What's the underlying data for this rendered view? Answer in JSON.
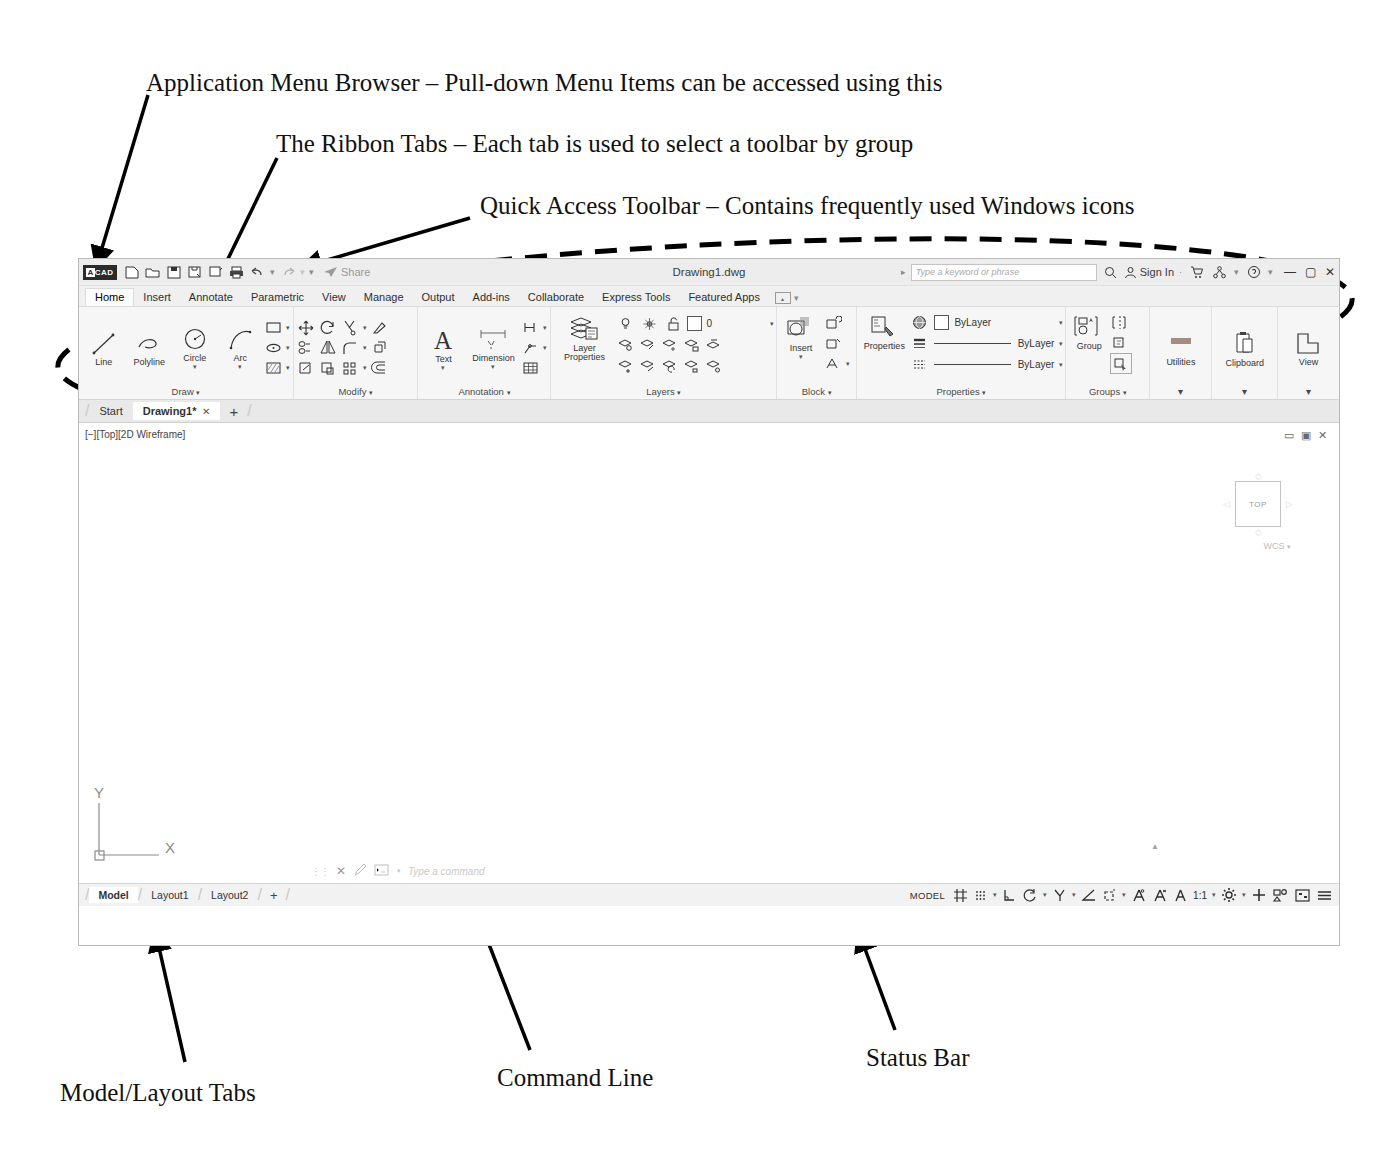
{
  "annotations": [
    {
      "id": "app-menu-browser",
      "text": "Application Menu Browser – Pull-down Menu Items can be accessed using this"
    },
    {
      "id": "ribbon-tabs",
      "text": "The Ribbon Tabs – Each tab is used to select a toolbar by group"
    },
    {
      "id": "quick-access-toolbar",
      "text": "Quick Access Toolbar – Contains frequently used Windows icons"
    },
    {
      "id": "ribbon",
      "text": "The Ribbon – Contains\nPanels which are a style of\ntoolbars tabulated by group"
    },
    {
      "id": "drawing-area",
      "text": "Drawing Area"
    },
    {
      "id": "model-layout-tabs",
      "text": "Model/Layout Tabs"
    },
    {
      "id": "command-line",
      "text": "Command Line"
    },
    {
      "id": "status-bar",
      "text": "Status Bar"
    }
  ],
  "app": {
    "logo": "CAD",
    "title": "Drawing1.dwg",
    "quick_access": [
      "new-icon",
      "open-icon",
      "save-icon",
      "saveas-icon",
      "plot-icon",
      "print-icon",
      "undo-icon",
      "redo-icon",
      "customize-icon"
    ],
    "share_label": "Share",
    "search_placeholder": "Type a keyword or phrase",
    "search_icon": "search-icon",
    "signin_label": "Sign In",
    "signin_icon": "person-icon",
    "titlebar_extras": [
      "cart-icon",
      "share-network-icon",
      "help-icon"
    ],
    "window_buttons": [
      "minimize",
      "maximize",
      "close"
    ],
    "ribbon_tabs": [
      {
        "label": "Home",
        "active": true
      },
      {
        "label": "Insert",
        "active": false
      },
      {
        "label": "Annotate",
        "active": false
      },
      {
        "label": "Parametric",
        "active": false
      },
      {
        "label": "View",
        "active": false
      },
      {
        "label": "Manage",
        "active": false
      },
      {
        "label": "Output",
        "active": false
      },
      {
        "label": "Add-ins",
        "active": false
      },
      {
        "label": "Collaborate",
        "active": false
      },
      {
        "label": "Express Tools",
        "active": false
      },
      {
        "label": "Featured Apps",
        "active": false
      }
    ],
    "ribbon_panels": [
      {
        "title": "Draw",
        "buttons": [
          "Line",
          "Polyline",
          "Circle",
          "Arc"
        ]
      },
      {
        "title": "Modify",
        "buttons": []
      },
      {
        "title": "Annotation",
        "buttons": [
          "Text",
          "Dimension"
        ]
      },
      {
        "title": "Layers",
        "buttons": [
          "Layer Properties"
        ],
        "current_layer": "0"
      },
      {
        "title": "Block",
        "buttons": [
          "Insert"
        ]
      },
      {
        "title": "Properties",
        "lines": [
          "ByLayer",
          "ByLayer",
          "ByLayer"
        ]
      },
      {
        "title": "Groups",
        "buttons": [
          "Group"
        ]
      },
      {
        "title": "Utilities",
        "buttons": [
          "Utilities"
        ]
      },
      {
        "title": "Clipboard",
        "buttons": [
          "Clipboard"
        ]
      },
      {
        "title": "View",
        "buttons": [
          "View"
        ]
      }
    ],
    "doc_tabs": [
      {
        "label": "Start",
        "active": false,
        "closable": false
      },
      {
        "label": "Drawing1*",
        "active": true,
        "closable": true
      }
    ],
    "doc_tab_add": "+",
    "canvas": {
      "viewport_label": "[−][Top][2D Wireframe]",
      "viewcube_label": "TOP",
      "wcs_label": "WCS",
      "ucs_x": "X",
      "ucs_y": "Y",
      "nav_controls": [
        "minimize-viewport-icon",
        "restore-viewport-icon",
        "close-viewport-icon"
      ]
    },
    "command_line": {
      "placeholder": "Type a command",
      "icons": [
        "grip-icon",
        "close-icon",
        "pen-icon",
        "history-icon"
      ],
      "dropdown": "▾"
    },
    "model_tabs": [
      {
        "label": "Model",
        "active": true
      },
      {
        "label": "Layout1",
        "active": false
      },
      {
        "label": "Layout2",
        "active": false
      }
    ],
    "model_tab_add": "+",
    "status_bar": {
      "space_label": "MODEL",
      "scale": "1:1",
      "items": [
        "grid-icon",
        "snap-icon",
        "infer-constraints-icon",
        "ortho-icon",
        "polar-tracking-icon",
        "osnap-icon",
        "otrack-icon",
        "lineweight-icon",
        "transparency-icon",
        "selection-cycling-icon",
        "annotation-scale-icon",
        "workspace-icon",
        "customize-icon",
        "isolate-objects-icon",
        "fullscreen-icon",
        "menu-icon"
      ]
    }
  }
}
